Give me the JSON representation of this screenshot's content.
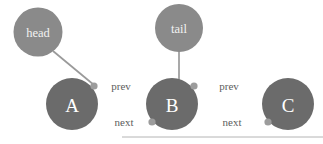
{
  "diagram": {
    "background_color": "#ffffff",
    "pointer_node_color": "#8a8a8a",
    "list_node_color": "#6b6b6b",
    "connector_dot_color": "#9c9c9c",
    "edge_color": "#999999",
    "edge_label_color": "#5d5d5d",
    "node_text_color": "#ffffff",
    "baseline_rule_color": "#b4b4b4"
  },
  "pointers": [
    {
      "id": "head",
      "label": "head",
      "cx": 38,
      "cy": 32,
      "r": 24.5,
      "target": "A"
    },
    {
      "id": "tail",
      "label": "tail",
      "cx": 179,
      "cy": 28,
      "r": 24,
      "target": "B"
    }
  ],
  "nodes": [
    {
      "id": "A",
      "label": "A",
      "cx": 72,
      "cy": 104,
      "r": 26
    },
    {
      "id": "B",
      "label": "B",
      "cx": 172,
      "cy": 104,
      "r": 26
    },
    {
      "id": "C",
      "label": "C",
      "cx": 288,
      "cy": 104,
      "r": 26
    }
  ],
  "connector_dots": [
    {
      "id": "A-prev-out",
      "cx": 94,
      "cy": 86,
      "r": 3.6
    },
    {
      "id": "B-prev-out",
      "cx": 194,
      "cy": 86,
      "r": 3.6
    },
    {
      "id": "B-next-out",
      "cx": 152,
      "cy": 122,
      "r": 3.6
    },
    {
      "id": "C-next-out",
      "cx": 268,
      "cy": 122,
      "r": 3.6
    }
  ],
  "edges": [
    {
      "id": "a-prev-b",
      "label": "prev",
      "from": "A",
      "to": "B",
      "direction": "right",
      "x1": 94,
      "x2": 148,
      "y": 86,
      "label_x": 121,
      "label_y": 86
    },
    {
      "id": "b-prev-c",
      "label": "prev",
      "from": "B",
      "to": "C",
      "direction": "right",
      "x1": 194,
      "x2": 264,
      "y": 86,
      "label_x": 229,
      "label_y": 86
    },
    {
      "id": "b-next-a",
      "label": "next",
      "from": "B",
      "to": "A",
      "direction": "left",
      "x1": 152,
      "x2": 96,
      "y": 122,
      "label_x": 124,
      "label_y": 122
    },
    {
      "id": "c-next-b",
      "label": "next",
      "from": "C",
      "to": "B",
      "direction": "left",
      "x1": 268,
      "x2": 196,
      "y": 122,
      "label_x": 232,
      "label_y": 122
    }
  ],
  "baseline_rule": {
    "x1": 122,
    "x2": 323,
    "y": 137
  }
}
